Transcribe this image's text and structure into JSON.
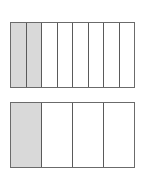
{
  "diagram": {
    "type": "fraction-bars",
    "bars": [
      {
        "name": "eighths",
        "parts": 8,
        "shaded": 2
      },
      {
        "name": "fourths",
        "parts": 4,
        "shaded": 1
      }
    ],
    "colors": {
      "shaded": "#d9d9d9",
      "border": "#5a5a5a",
      "background": "#ffffff"
    }
  }
}
